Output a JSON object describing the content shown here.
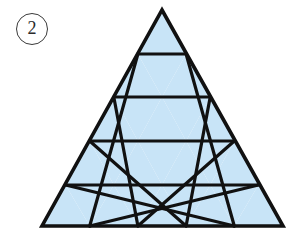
{
  "figure": {
    "label": "2",
    "label_icon": "circled-number-badge",
    "shape_name": "subdivided-equilateral-triangle",
    "rows": 5,
    "small_triangle_count": 25,
    "upward_triangle_count": 15,
    "downward_triangle_count": 10,
    "colors": {
      "fill": "#c8e4f7",
      "stroke": "#111111",
      "background": "#ffffff",
      "label_stroke": "#3a3a3a",
      "label_text": "#2b2b2b"
    },
    "geometry": {
      "apex_x": 162,
      "apex_y": 10,
      "base_left_x": 42,
      "base_right_x": 283,
      "base_y": 226,
      "row_y": [
        10,
        54,
        97,
        141,
        185,
        226
      ],
      "stroke_width_outer": 3.6,
      "stroke_width_inner": 3.2
    }
  }
}
